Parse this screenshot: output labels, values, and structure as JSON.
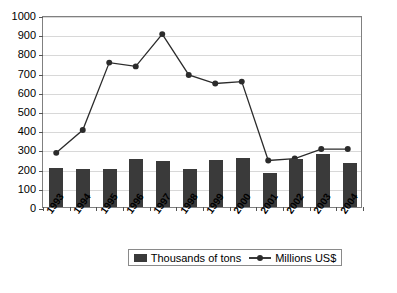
{
  "chart_data": {
    "type": "bar",
    "title": "",
    "xlabel": "",
    "ylabel": "",
    "ylim": [
      0,
      1000
    ],
    "ytick_step": 100,
    "grid": true,
    "legend_position": "bottom",
    "categories": [
      "1993",
      "1994",
      "1995",
      "1996",
      "1997",
      "1998",
      "1999",
      "2000",
      "2001",
      "2002",
      "2003",
      "2004"
    ],
    "series": [
      {
        "name": "Thousands of tons",
        "type": "bar",
        "color": "#3a3a3a",
        "values": [
          205,
          200,
          200,
          250,
          240,
          200,
          245,
          255,
          175,
          250,
          275,
          230
        ]
      },
      {
        "name": "Millions US$",
        "type": "line",
        "color": "#2b2b2b",
        "marker": "circle",
        "values": [
          285,
          405,
          760,
          740,
          910,
          695,
          650,
          660,
          245,
          255,
          305,
          305
        ]
      }
    ],
    "ytick_labels": [
      "1000",
      "900",
      "800",
      "700",
      "600",
      "500",
      "400",
      "300",
      "200",
      "100",
      "0"
    ],
    "ytick_values": [
      1000,
      900,
      800,
      700,
      600,
      500,
      400,
      300,
      200,
      100,
      0
    ]
  },
  "legend": {
    "entries": [
      {
        "label": "Thousands of tons",
        "marker": "bar-swatch"
      },
      {
        "label": "Millions US$",
        "marker": "line-marker-swatch"
      }
    ]
  },
  "caption": {
    "text": ""
  }
}
